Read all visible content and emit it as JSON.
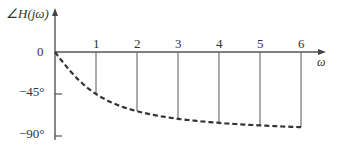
{
  "chart_data": {
    "type": "line",
    "title": "",
    "ylabel": "∠H(jω)",
    "xlabel": "ω",
    "x_ticks": [
      "1",
      "2",
      "3",
      "4",
      "5",
      "6"
    ],
    "y_ticks": [
      "0",
      "−45°",
      "−90°"
    ],
    "ylim": [
      -90,
      0
    ],
    "xlim": [
      0,
      6
    ],
    "grid": false,
    "series": [
      {
        "name": "phase",
        "style": "dashed",
        "x": [
          0,
          0.5,
          1,
          1.5,
          2,
          2.5,
          3,
          3.5,
          4,
          4.5,
          5,
          5.5,
          6
        ],
        "values": [
          0,
          -26.6,
          -45,
          -56.3,
          -63.4,
          -68.2,
          -71.6,
          -74.1,
          -76.0,
          -77.5,
          -78.7,
          -79.7,
          -80.5
        ]
      }
    ],
    "drop_lines_at": [
      1,
      2,
      3,
      4,
      5,
      6
    ]
  },
  "labels": {
    "y_axis": "∠H(jω)",
    "x_axis": "ω",
    "zero": "0",
    "m45": "−45°",
    "m90": "−90°",
    "t1": "1",
    "t2": "2",
    "t3": "3",
    "t4": "4",
    "t5": "5",
    "t6": "6"
  }
}
